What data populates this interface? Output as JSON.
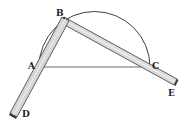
{
  "figure": {
    "type": "geometric-diagram",
    "colors": {
      "ink": "#2a2a2a",
      "ruler_fill": "#dcdcdc",
      "ruler_edge": "#3a3a3a",
      "background": "#ffffff"
    },
    "points": {
      "A": {
        "label": "A",
        "x": 39,
        "y": 67
      },
      "B": {
        "label": "B",
        "x": 66,
        "y": 20
      },
      "C": {
        "label": "C",
        "x": 150,
        "y": 67
      },
      "D": {
        "label": "D",
        "x": 14,
        "y": 115
      },
      "E": {
        "label": "E",
        "x": 175,
        "y": 83
      }
    },
    "labels": {
      "A": "A",
      "B": "B",
      "C": "C",
      "D": "D",
      "E": "E"
    }
  }
}
